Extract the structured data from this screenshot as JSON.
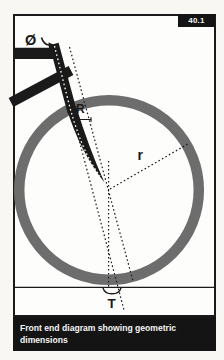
{
  "figure": {
    "number": "40.1",
    "caption": "Front end diagram showing geometric dimensions"
  },
  "diagram": {
    "labels": {
      "steerer_diameter": "Ø",
      "fork_rake": "R",
      "wheel_radius": "r",
      "trail": "T"
    },
    "colors": {
      "ink": "#1a1a1a",
      "wheel_gray": "#6d6d6d",
      "paper": "#fdfdfb",
      "page_background": "#f8f7f4",
      "caption_background": "#141414",
      "caption_text": "#f5f5f5"
    }
  }
}
